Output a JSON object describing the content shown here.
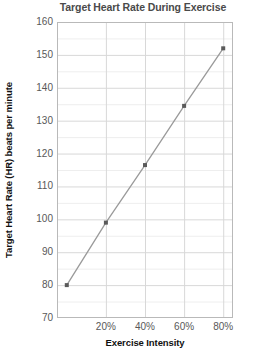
{
  "chart_data": {
    "type": "line",
    "title": "Target Heart Rate During Exercise",
    "xlabel": "Exercise Intensity",
    "ylabel": "Target Heart Rate (HR) beats per minute",
    "x": [
      0,
      20,
      40,
      60,
      80
    ],
    "xtick_labels": [
      "20%",
      "40%",
      "60%",
      "80%"
    ],
    "xtick_values": [
      20,
      40,
      60,
      80
    ],
    "values": [
      80,
      99,
      116.5,
      134.5,
      152
    ],
    "series": [
      {
        "name": "Target Heart Rate",
        "values": [
          80,
          99,
          116.5,
          134.5,
          152
        ]
      }
    ],
    "ytick_labels": [
      "160",
      "150",
      "140",
      "130",
      "120",
      "110",
      "100",
      "90",
      "80",
      "70"
    ],
    "ytick_values": [
      160,
      150,
      140,
      130,
      120,
      110,
      100,
      90,
      80,
      70
    ],
    "xlim": [
      -5,
      85
    ],
    "ylim": [
      70,
      160
    ],
    "grid": true,
    "grid_major_step": 10,
    "grid_minor_step": 5,
    "legend": "none",
    "marker": "square",
    "colors": {
      "line": "#9a9a9a",
      "marker": "#5a5a5a",
      "grid_major": "#d8d8d8",
      "grid_minor": "#eeeeee",
      "axis": "#b9b9b9",
      "title_text": "#4a4a4a",
      "tick_text": "#585858",
      "axis_label_text": "#111111"
    }
  }
}
